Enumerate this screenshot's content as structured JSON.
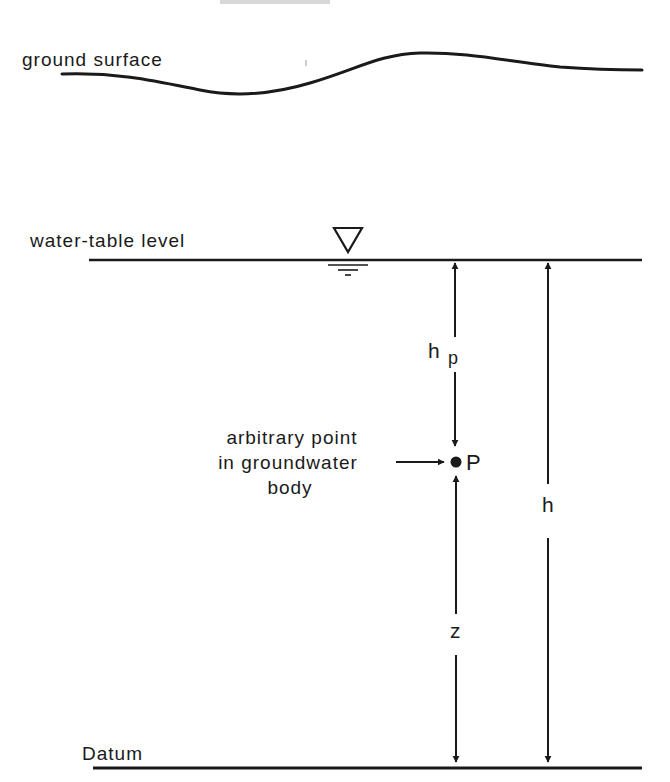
{
  "diagram": {
    "header_fragment": "",
    "ground_surface_label": "ground surface",
    "water_table_label": "water-table level",
    "point_label_lines": [
      "arbitrary point",
      "in groundwater",
      "body"
    ],
    "point_name": "P",
    "pressure_head_label": "h",
    "pressure_head_subscript": "p",
    "elevation_head_label": "z",
    "total_head_label": "h",
    "datum_label": "Datum",
    "colors": {
      "ink": "#1a1a1a",
      "background": "#ffffff"
    }
  }
}
